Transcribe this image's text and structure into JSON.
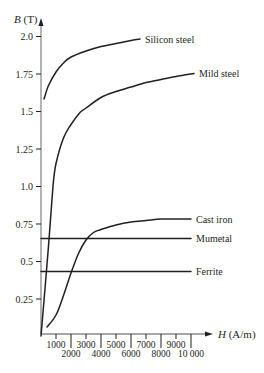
{
  "chart_data": {
    "type": "line",
    "title": "",
    "xlabel": "H (A/m)",
    "ylabel": "B (T)",
    "xlabel_italic": "H",
    "xlabel_unit": "(A/m)",
    "ylabel_italic": "B",
    "ylabel_unit": "(T)",
    "xlim": [
      0,
      10000
    ],
    "ylim": [
      0,
      2.0
    ],
    "grid": false,
    "legend": "inline labels at curve ends (right side)",
    "x_ticks": [
      1000,
      2000,
      3000,
      4000,
      5000,
      6000,
      7000,
      8000,
      9000,
      10000
    ],
    "x_tick_labels": [
      "1000",
      "2000",
      "3000",
      "4000",
      "5000",
      "6000",
      "7000",
      "8000",
      "9000",
      "10 000"
    ],
    "y_ticks": [
      0.25,
      0.5,
      0.75,
      1.0,
      1.25,
      1.5,
      1.75,
      2.0
    ],
    "y_tick_labels": [
      "0.25",
      "0.5",
      "0.75",
      "1.0",
      "1.25",
      "1.5",
      "1.75",
      "2.0"
    ],
    "series": [
      {
        "name": "Silicon steel",
        "x": [
          200,
          500,
          1000,
          1500,
          2000,
          3000,
          4000,
          5000,
          6000,
          6600
        ],
        "y": [
          1.58,
          1.67,
          1.76,
          1.82,
          1.86,
          1.9,
          1.93,
          1.95,
          1.97,
          1.98
        ]
      },
      {
        "name": "Mild steel",
        "x": [
          0,
          500,
          800,
          1000,
          1500,
          2000,
          2600,
          3000,
          4000,
          5000,
          6000,
          7000,
          8000,
          9000,
          10200
        ],
        "y": [
          0,
          0.6,
          1.0,
          1.15,
          1.32,
          1.41,
          1.49,
          1.52,
          1.59,
          1.63,
          1.66,
          1.69,
          1.71,
          1.73,
          1.75
        ]
      },
      {
        "name": "Cast iron",
        "x": [
          400,
          1000,
          1500,
          2000,
          2500,
          3000,
          3500,
          4000,
          5000,
          6000,
          7000,
          8000,
          9000,
          10000
        ],
        "y": [
          0.06,
          0.14,
          0.27,
          0.42,
          0.55,
          0.64,
          0.69,
          0.71,
          0.74,
          0.76,
          0.77,
          0.78,
          0.78,
          0.78
        ]
      },
      {
        "name": "Mumetal",
        "x": [
          0,
          10000
        ],
        "y": [
          0.65,
          0.65
        ]
      },
      {
        "name": "Ferrite",
        "x": [
          0,
          10000
        ],
        "y": [
          0.43,
          0.43
        ]
      }
    ]
  }
}
